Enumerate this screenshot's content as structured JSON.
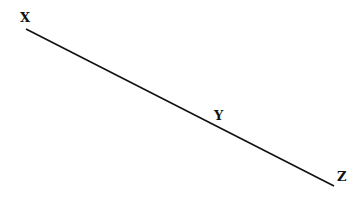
{
  "diagram": {
    "type": "line-segment-with-points",
    "segment": {
      "x1": 26,
      "y1": 29,
      "x2": 334,
      "y2": 186,
      "color": "#111111",
      "stroke_width": 1.6
    },
    "points": [
      {
        "label": "X",
        "x": 20,
        "y": 22
      },
      {
        "label": "Y",
        "x": 214,
        "y": 120
      },
      {
        "label": "Z",
        "x": 337,
        "y": 181
      }
    ]
  }
}
